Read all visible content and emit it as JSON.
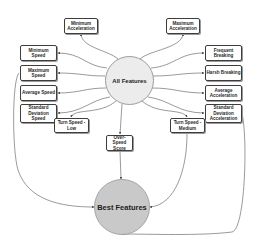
{
  "diagram": {
    "hub": {
      "label": "All Features"
    },
    "sink": {
      "label": "Best Features"
    },
    "features": [
      {
        "id": "min-accel",
        "label": "Minimum Acceleration"
      },
      {
        "id": "max-accel",
        "label": "Maximum Acceleration"
      },
      {
        "id": "min-speed",
        "label": "Minimum Speed"
      },
      {
        "id": "max-speed",
        "label": "Maximum Speed"
      },
      {
        "id": "avg-speed",
        "label": "Average Speed"
      },
      {
        "id": "std-speed",
        "label": "Standard Deviation Speed"
      },
      {
        "id": "freq-breaking",
        "label": "Frequent Breaking"
      },
      {
        "id": "harsh-breaking",
        "label": "Harsh Breaking"
      },
      {
        "id": "avg-accel",
        "label": "Average Acceleration"
      },
      {
        "id": "std-accel",
        "label": "Standard Deviation Acceleration"
      },
      {
        "id": "turn-low",
        "label": "Turn Speed - Low"
      },
      {
        "id": "over-speed",
        "label": "Over-Speed Score"
      },
      {
        "id": "turn-medium",
        "label": "Turn Speed - Medium"
      }
    ],
    "selected_to_best": [
      "Maximum Speed",
      "Over-Speed Score",
      "Turn Speed - Medium",
      "Standard Deviation Acceleration"
    ],
    "colors": {
      "hub_fill": "#ececec",
      "sink_fill": "#c9c9c9",
      "edge": "#555555",
      "box_border": "#3d3d3d"
    }
  }
}
